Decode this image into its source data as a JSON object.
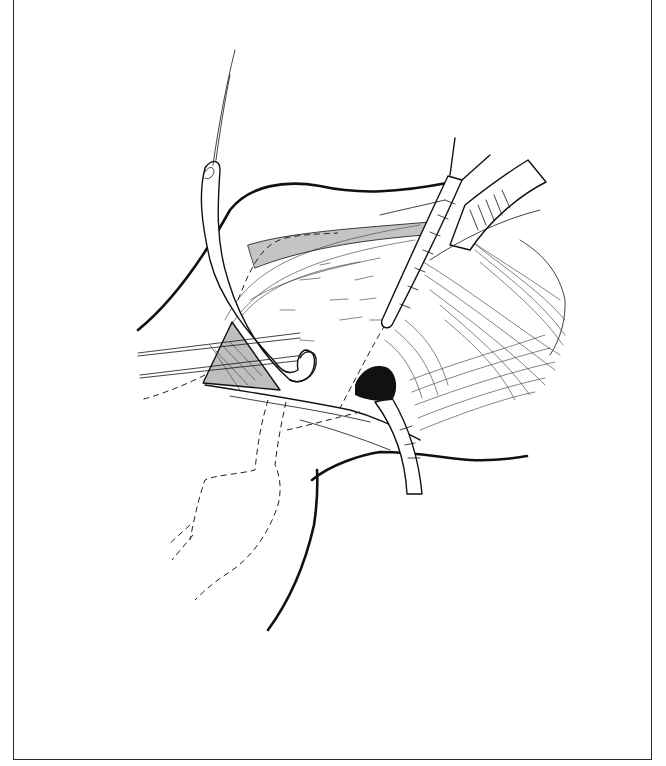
{
  "figure": {
    "kind": "surgical line illustration",
    "style": "black ink line drawing on white",
    "border_color": "#2a2a2a",
    "background_color": "#ffffff",
    "ink_color": "#111111",
    "elements": [
      {
        "name": "upper-skin-contour",
        "type": "bold curve"
      },
      {
        "name": "lower-skin-contour",
        "type": "bold curve"
      },
      {
        "name": "left-skin-contour",
        "type": "bold curve"
      },
      {
        "name": "vessel-loop-tube",
        "type": "tubular structure held by suture"
      },
      {
        "name": "suture-thread",
        "type": "thin line"
      },
      {
        "name": "upper-retractor",
        "type": "curved retractor blade"
      },
      {
        "name": "lower-retractor",
        "type": "curved retractor blade"
      },
      {
        "name": "forceps-instrument",
        "type": "instrument shaft"
      },
      {
        "name": "muscle-fibers",
        "type": "hatched tissue"
      },
      {
        "name": "dark-opening",
        "type": "filled dark area"
      },
      {
        "name": "dashed-outline",
        "type": "hidden structure outline"
      },
      {
        "name": "traction-threads",
        "type": "thin parallel lines"
      }
    ]
  }
}
